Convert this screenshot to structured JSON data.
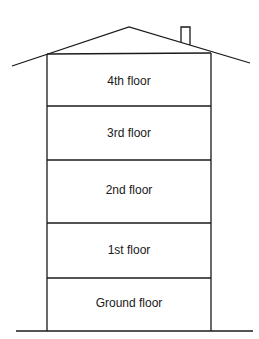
{
  "diagram": {
    "type": "building-cross-section",
    "floors": [
      {
        "label": "4th floor",
        "label_y": 74
      },
      {
        "label": "3rd floor",
        "label_y": 126
      },
      {
        "label": "2nd floor",
        "label_y": 183
      },
      {
        "label": "1st floor",
        "label_y": 243
      },
      {
        "label": "Ground floor",
        "label_y": 296
      }
    ],
    "line_color": "#1a1a1a"
  }
}
